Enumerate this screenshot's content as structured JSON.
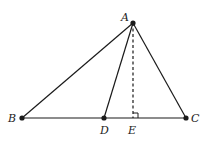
{
  "figure": {
    "type": "geometry",
    "stroke_color": "#1a1a1a",
    "points": {
      "A": {
        "x": 133,
        "y": 23,
        "label": "A",
        "lx": 121,
        "ly": 21
      },
      "B": {
        "x": 22,
        "y": 118,
        "label": "B",
        "lx": 8,
        "ly": 122
      },
      "C": {
        "x": 186,
        "y": 118,
        "label": "C",
        "lx": 191,
        "ly": 122
      },
      "D": {
        "x": 104,
        "y": 118,
        "label": "D",
        "lx": 100,
        "ly": 134
      },
      "E": {
        "x": 133,
        "y": 118,
        "label": "E",
        "lx": 128,
        "ly": 134
      }
    },
    "segments": [
      {
        "from": "A",
        "to": "B",
        "style": "solid"
      },
      {
        "from": "A",
        "to": "C",
        "style": "solid"
      },
      {
        "from": "B",
        "to": "C",
        "style": "solid"
      },
      {
        "from": "A",
        "to": "D",
        "style": "solid"
      },
      {
        "from": "A",
        "to": "E",
        "style": "dashed"
      }
    ],
    "right_angle_marker": {
      "at": "E",
      "size": 5
    },
    "labels": {
      "A": "A",
      "B": "B",
      "C": "C",
      "D": "D",
      "E": "E"
    }
  }
}
